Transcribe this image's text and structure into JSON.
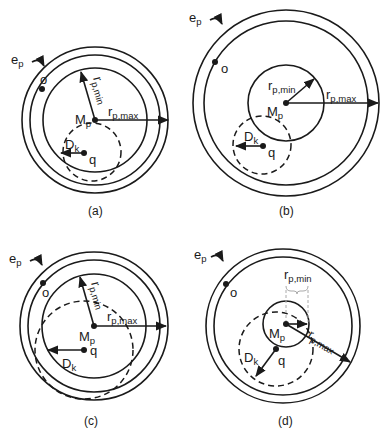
{
  "figure": {
    "panels": [
      {
        "id": "a",
        "caption": "(a)",
        "labels": {
          "ep": "e",
          "ep_sub": "p",
          "o": "o",
          "rmin": "r",
          "rmin_sub": "p,min",
          "rmax": "r",
          "rmax_sub": "p,max",
          "mp": "M",
          "mp_sub": "p",
          "dk": "D",
          "dk_sub": "k",
          "q": "q"
        }
      },
      {
        "id": "b",
        "caption": "(b)",
        "labels": {
          "ep": "e",
          "ep_sub": "p",
          "o": "o",
          "rmin": "r",
          "rmin_sub": "p,min",
          "rmax": "r",
          "rmax_sub": "p,max",
          "mp": "M",
          "mp_sub": "p",
          "dk": "D",
          "dk_sub": "k",
          "q": "q"
        }
      },
      {
        "id": "c",
        "caption": "(c)",
        "labels": {
          "ep": "e",
          "ep_sub": "p",
          "o": "o",
          "rmin": "r",
          "rmin_sub": "p,min",
          "rmax": "r",
          "rmax_sub": "p,max",
          "mp": "M",
          "mp_sub": "p",
          "dk": "D",
          "dk_sub": "k",
          "q": "q"
        }
      },
      {
        "id": "d",
        "caption": "(d)",
        "labels": {
          "ep": "e",
          "ep_sub": "p",
          "o": "o",
          "rmin": "r",
          "rmin_sub": "p,min",
          "rmax": "r",
          "rmax_sub": "p,max",
          "mp": "M",
          "mp_sub": "p",
          "dk": "D",
          "dk_sub": "k",
          "q": "q"
        }
      }
    ]
  }
}
